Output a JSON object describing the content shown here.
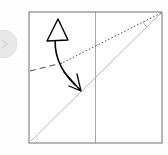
{
  "canvas": {
    "width": 168,
    "height": 155,
    "background_color": "#fefefe",
    "title": "Origami fold step diagram"
  },
  "palette": {
    "paper_border": "#6e6e6e",
    "fold_line": "#b9b9b9",
    "center_crease": "#9e9e9e",
    "reference_dotted": "#3a3a3a",
    "reference_dashed": "#4a4a4a",
    "motion_arrow": "#000000",
    "badge_circle": "#e8e8e8",
    "background": "#fefefe"
  },
  "paper": {
    "label": "square-sheet",
    "x": 29,
    "y": 12,
    "width": 133,
    "height": 131,
    "stroke_width": 1,
    "fill": "#ffffff"
  },
  "center_crease": {
    "label": "vertical-center-crease",
    "x1": 95.5,
    "y1": 12,
    "x2": 95.5,
    "y2": 143,
    "stroke_width": 0.9,
    "style": "solid"
  },
  "fold_line": {
    "label": "main-diagonal-fold",
    "x1": 31,
    "y1": 141,
    "x2": 161,
    "y2": 13,
    "stroke_width": 1,
    "style": "solid"
  },
  "reference_dotted": {
    "label": "dotted-reference-line",
    "x1": 60,
    "y1": 64,
    "x2": 161,
    "y2": 13,
    "stroke_width": 1,
    "dash_pattern": "1.4 2.2"
  },
  "reference_dashed": {
    "label": "dashed-reference-line",
    "x1": 30,
    "y1": 71,
    "x2": 62,
    "y2": 63,
    "stroke_width": 1,
    "dash_pattern": "6 4"
  },
  "corner_angle_arc": {
    "label": "corner-angle-arc",
    "vertex_x": 161,
    "vertex_y": 13,
    "radius": 20,
    "stroke_width": 0.8
  },
  "motion_arrow": {
    "label": "fold-motion-double-arrow",
    "path": "M 56,33 C 53,50 58,68 75,85",
    "stroke_width": 1.6,
    "head_up": {
      "type": "hollow-triangle",
      "tip_x": 58,
      "tip_y": 19,
      "left_x": 47,
      "left_y": 41,
      "right_x": 68,
      "right_y": 40,
      "fill": "#ffffff"
    },
    "head_down": {
      "type": "open-v-barbs",
      "tip_x": 81,
      "tip_y": 91,
      "barb_a_x": 64,
      "barb_a_y": 72,
      "barb_b_x": 69,
      "barb_b_y": 86,
      "barb_c_x": 77,
      "barb_c_y": 74
    }
  },
  "badge": {
    "label": "step-marker-badge",
    "cx": 3,
    "cy": 44,
    "r": 14,
    "fill": "#e8e8e8",
    "stroke": "#e2e2e2",
    "glyph": "step-marker-icon"
  },
  "annotations": {
    "step_text": "",
    "caption": ""
  }
}
